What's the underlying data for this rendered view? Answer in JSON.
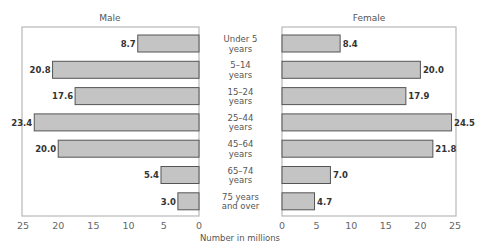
{
  "chart_data": {
    "type": "bar",
    "orientation": "horizontal",
    "layout": "population-pyramid",
    "title": "",
    "xlabel": "Number in millions",
    "ylabel": "",
    "xlim": [
      0,
      25
    ],
    "ticks": [
      "0",
      "5",
      "10",
      "15",
      "20",
      "25"
    ],
    "tick_values": [
      0,
      5,
      10,
      15,
      20,
      25
    ],
    "grid": false,
    "categories": [
      [
        "Under 5",
        "years"
      ],
      [
        "5–14",
        "years"
      ],
      [
        "15–24",
        "years"
      ],
      [
        "25–44",
        "years"
      ],
      [
        "45–64",
        "years"
      ],
      [
        "65–74",
        "years"
      ],
      [
        "75 years",
        "and over"
      ]
    ],
    "series": [
      {
        "name": "Male",
        "values": [
          8.7,
          20.8,
          17.6,
          23.4,
          20.0,
          5.4,
          3.0
        ],
        "labels": [
          "8.7",
          "20.8",
          "17.6",
          "23.4",
          "20.0",
          "5.4",
          "3.0"
        ],
        "side": "left"
      },
      {
        "name": "Female",
        "values": [
          8.4,
          20.0,
          17.9,
          24.5,
          21.8,
          7.0,
          4.7
        ],
        "labels": [
          "8.4",
          "20.0",
          "17.9",
          "24.5",
          "21.8",
          "7.0",
          "4.7"
        ],
        "side": "right"
      }
    ],
    "colors": {
      "bar_fill": "#c4c4c4",
      "bar_stroke": "#555555",
      "frame": "#b8b8b8"
    }
  }
}
